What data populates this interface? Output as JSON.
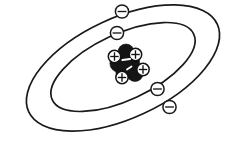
{
  "figure": {
    "title": "Bohr model atom diagram",
    "caption": "",
    "background_color": "#ffffff",
    "line_color": "#1a1a1a",
    "width": 247,
    "height": 142
  },
  "nucleus": {
    "label": "nucleus",
    "center_x": 127,
    "center_y": 64,
    "proton_count": 4,
    "neutron_count": 5,
    "proton_symbol": "+",
    "neutron_symbol": "",
    "proton_fill": "#ffffff",
    "neutron_fill": "#151515",
    "protons": [
      {
        "name": "proton-1",
        "cx": 114.5,
        "cy": 56.5,
        "r": 6.2,
        "symbol": "+"
      },
      {
        "name": "proton-2",
        "cx": 135.5,
        "cy": 54.5,
        "r": 6.2,
        "symbol": "+"
      },
      {
        "name": "proton-3",
        "cx": 143.0,
        "cy": 69.5,
        "r": 6.2,
        "symbol": "+"
      },
      {
        "name": "proton-4",
        "cx": 122.0,
        "cy": 77.5,
        "r": 6.2,
        "symbol": "+"
      }
    ],
    "neutrons": [
      {
        "name": "neutron-1",
        "cx": 126.0,
        "cy": 52.0,
        "r": 8.0
      },
      {
        "name": "neutron-2",
        "cx": 118.5,
        "cy": 63.5,
        "r": 8.6
      },
      {
        "name": "neutron-3",
        "cx": 131.5,
        "cy": 62.0,
        "r": 8.2
      },
      {
        "name": "neutron-4",
        "cx": 135.0,
        "cy": 73.5,
        "r": 8.0
      },
      {
        "name": "neutron-5",
        "cx": 124.0,
        "cy": 72.0,
        "r": 8.2
      }
    ]
  },
  "orbits": [
    {
      "name": "inner-orbit",
      "shell_number": 1,
      "rx": 78,
      "ry": 33,
      "cx": 123,
      "cy": 67,
      "rotation_deg": -25,
      "stroke_width": 1.7,
      "electron_count": 2
    },
    {
      "name": "outer-orbit",
      "shell_number": 2,
      "rx": 104,
      "ry": 50,
      "cx": 123,
      "cy": 68,
      "rotation_deg": -25,
      "stroke_width": 1.7,
      "electron_count": 2
    }
  ],
  "electrons": [
    {
      "name": "electron-outer-top",
      "cx": 122.0,
      "cy": 11.5,
      "r": 6.6,
      "symbol": "−",
      "orbit": "outer-orbit"
    },
    {
      "name": "electron-inner-top",
      "cx": 117.0,
      "cy": 33.0,
      "r": 6.6,
      "symbol": "−",
      "orbit": "inner-orbit"
    },
    {
      "name": "electron-inner-bottom",
      "cx": 157.5,
      "cy": 89.0,
      "r": 6.6,
      "symbol": "−",
      "orbit": "inner-orbit"
    },
    {
      "name": "electron-outer-bottom",
      "cx": 169.5,
      "cy": 107.0,
      "r": 6.6,
      "symbol": "−",
      "orbit": "outer-orbit"
    }
  ],
  "legend": {
    "proton_charge": "+",
    "electron_charge": "−"
  }
}
